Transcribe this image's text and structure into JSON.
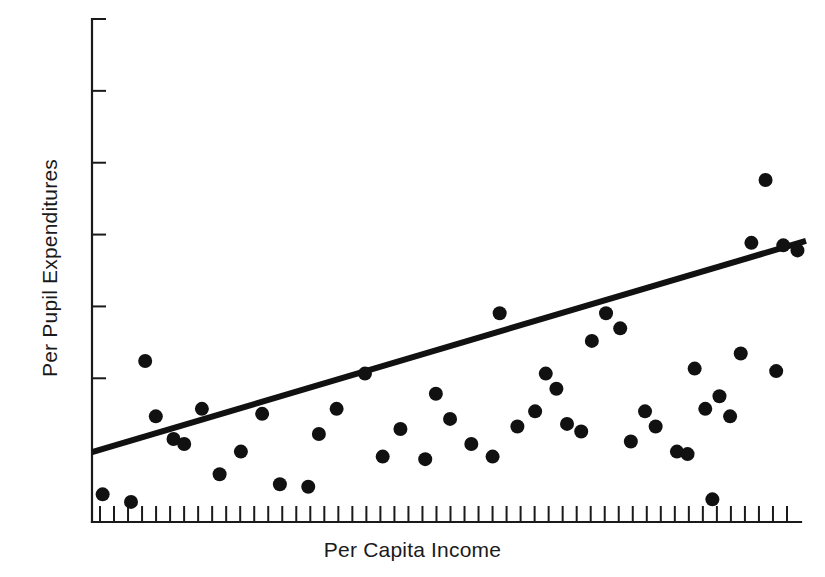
{
  "chart_data": {
    "type": "scatter",
    "title": "",
    "xlabel": "Per Capita Income",
    "ylabel": "Per Pupil Expenditures",
    "grid": false,
    "legend": false,
    "axes": {
      "x_axis_ticks_count": 50,
      "y_axis_ticks_count": 6,
      "x_tick_labels": [],
      "y_tick_labels": [],
      "xlim": [
        0,
        100
      ],
      "ylim": [
        0,
        100
      ],
      "tick_direction": "inward",
      "spines": [
        "left",
        "bottom"
      ]
    },
    "annotations": [
      "Positive linear association between per capita income and per pupil expenditures",
      "A least-squares regression line is drawn through the point cloud"
    ],
    "series": [
      {
        "name": "School districts",
        "marker": "filled-circle",
        "color": "#111111",
        "marker_radius_px": 7,
        "points": [
          [
            1.5,
            5.5
          ],
          [
            5.5,
            4.0
          ],
          [
            7.5,
            32.0
          ],
          [
            9.0,
            21.0
          ],
          [
            11.5,
            16.5
          ],
          [
            13.0,
            15.5
          ],
          [
            15.5,
            22.5
          ],
          [
            18.0,
            9.5
          ],
          [
            21.0,
            14.0
          ],
          [
            24.0,
            21.5
          ],
          [
            26.5,
            7.5
          ],
          [
            30.5,
            7.0
          ],
          [
            32.0,
            17.5
          ],
          [
            34.5,
            22.5
          ],
          [
            38.5,
            29.5
          ],
          [
            41.0,
            13.0
          ],
          [
            43.5,
            18.5
          ],
          [
            47.0,
            12.5
          ],
          [
            48.5,
            25.5
          ],
          [
            50.5,
            20.5
          ],
          [
            53.5,
            15.5
          ],
          [
            56.5,
            13.0
          ],
          [
            57.5,
            41.5
          ],
          [
            60.0,
            19.0
          ],
          [
            62.5,
            22.0
          ],
          [
            64.0,
            29.5
          ],
          [
            65.5,
            26.5
          ],
          [
            67.0,
            19.5
          ],
          [
            69.0,
            18.0
          ],
          [
            70.5,
            36.0
          ],
          [
            72.5,
            41.5
          ],
          [
            74.5,
            38.5
          ],
          [
            76.0,
            16.0
          ],
          [
            78.0,
            22.0
          ],
          [
            79.5,
            19.0
          ],
          [
            82.5,
            14.0
          ],
          [
            84.0,
            13.5
          ],
          [
            85.0,
            30.5
          ],
          [
            86.5,
            22.5
          ],
          [
            87.5,
            4.5
          ],
          [
            88.5,
            25.0
          ],
          [
            90.0,
            21.0
          ],
          [
            91.5,
            33.5
          ],
          [
            93.0,
            55.5
          ],
          [
            95.0,
            68.0
          ],
          [
            96.5,
            30.0
          ],
          [
            97.5,
            55.0
          ],
          [
            99.5,
            54.0
          ]
        ]
      }
    ],
    "trend_line": {
      "name": "least-squares regression line",
      "color": "#111111",
      "width_px": 6,
      "x_start": 0.0,
      "y_start": 13.9,
      "x_end": 100.0,
      "y_end": 55.9
    }
  }
}
